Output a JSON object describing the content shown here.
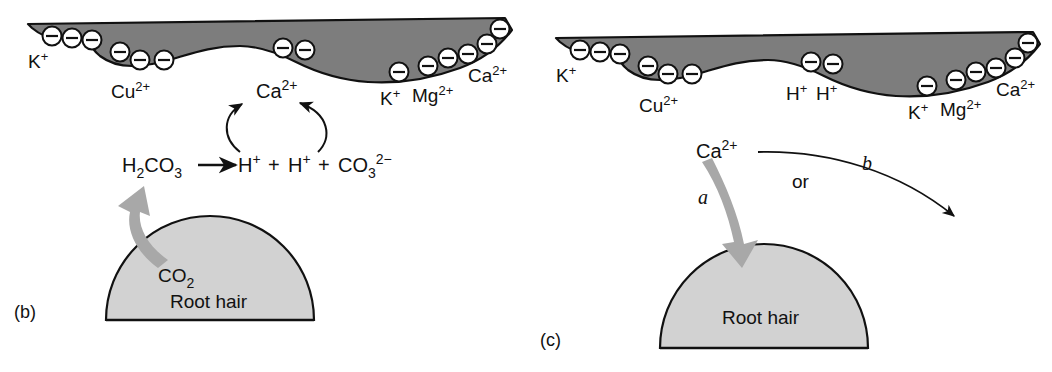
{
  "figure": {
    "type": "diagram",
    "colors": {
      "clay_fill": "#7d7d7d",
      "clay_stroke": "#111111",
      "root_hair_fill": "#d2d2d2",
      "root_hair_stroke": "#111111",
      "ion_circle_fill": "#ffffff",
      "ion_circle_stroke": "#111111",
      "thick_arrow_fill": "#a8a8a8",
      "thin_arrow_stroke": "#111111",
      "background": "#ffffff",
      "text": "#111111"
    }
  },
  "panels": [
    {
      "id": "b",
      "label": "(b)",
      "colloid": {
        "name": "clay-colloid",
        "ion_charge_glyph": "−",
        "ion_clusters": [
          {
            "label": "K+",
            "display": "K",
            "superscript": "+",
            "count": 3
          },
          {
            "label": "Cu2+",
            "display": "Cu",
            "superscript": "2+",
            "count": 3
          },
          {
            "label": "Ca2+ (center)",
            "display": "Ca",
            "superscript": "2+",
            "count": 2
          },
          {
            "label": "K+",
            "display": "K",
            "superscript": "+",
            "count": 1
          },
          {
            "label": "Mg2+",
            "display": "Mg",
            "superscript": "2+",
            "count": 3
          },
          {
            "label": "Ca2+",
            "display": "Ca",
            "superscript": "2+",
            "count": 2
          }
        ]
      },
      "center_species": {
        "display": "Ca",
        "superscript": "2+"
      },
      "equation": {
        "reactant": {
          "display": "H",
          "sub1": "2",
          "mid": "CO",
          "sub2": "3"
        },
        "arrow": "→",
        "products": [
          {
            "display": "H",
            "superscript": "+"
          },
          {
            "plus": "+"
          },
          {
            "display": "H",
            "superscript": "+"
          },
          {
            "plus": "+"
          },
          {
            "display": "CO",
            "subscript": "3",
            "superscript": "2−"
          }
        ]
      },
      "gas_label": {
        "display": "CO",
        "subscript": "2"
      },
      "root_hair_label": "Root hair",
      "exchange_arrows": 2
    },
    {
      "id": "c",
      "label": "(c)",
      "colloid": {
        "name": "clay-colloid",
        "ion_charge_glyph": "−",
        "ion_clusters": [
          {
            "label": "K+",
            "display": "K",
            "superscript": "+",
            "count": 3
          },
          {
            "label": "Cu2+",
            "display": "Cu",
            "superscript": "2+",
            "count": 3
          },
          {
            "label": "H+H+",
            "display": "H",
            "superscript": "+",
            "count": 2
          },
          {
            "label": "K+",
            "display": "K",
            "superscript": "+",
            "count": 1
          },
          {
            "label": "Mg2+",
            "display": "Mg",
            "superscript": "2+",
            "count": 3
          },
          {
            "label": "Ca2+",
            "display": "Ca",
            "superscript": "2+",
            "count": 2
          }
        ]
      },
      "center_species_hplus_left": {
        "display": "H",
        "superscript": "+"
      },
      "center_species_hplus_right": {
        "display": "H",
        "superscript": "+"
      },
      "released_species": {
        "display": "Ca",
        "superscript": "2+"
      },
      "pathway_a": "a",
      "pathway_b": "b",
      "or_label": "or",
      "root_hair_label": "Root hair"
    }
  ],
  "ion_texts": {
    "k_plus": "K",
    "k_sup": "+",
    "cu": "Cu",
    "cu_sup": "2+",
    "ca": "Ca",
    "ca_sup": "2+",
    "mg": "Mg",
    "mg_sup": "2+",
    "h": "H",
    "h_sup": "+",
    "minus_glyph": "−"
  },
  "equation_texts": {
    "h2co3_h": "H",
    "h2co3_2": "2",
    "h2co3_co": "CO",
    "h2co3_3": "3",
    "plus": "+",
    "co3_co": "CO",
    "co3_3": "3",
    "co3_sup": "2−",
    "co2_co": "CO",
    "co2_2": "2"
  }
}
